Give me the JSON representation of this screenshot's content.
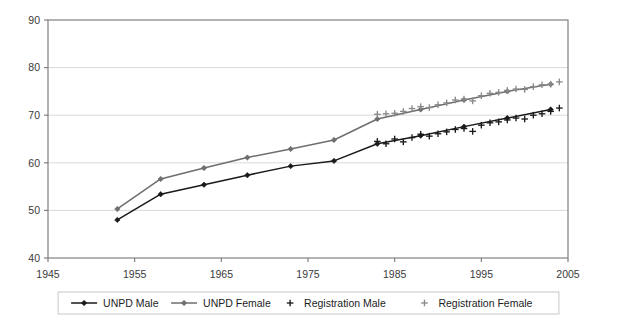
{
  "chart_data": {
    "type": "line",
    "title": "",
    "subtitle": "",
    "xlabel": "",
    "ylabel": "",
    "xlim": [
      1945,
      2005
    ],
    "ylim": [
      40,
      90
    ],
    "xticks": [
      1945,
      1955,
      1965,
      1975,
      1985,
      1995,
      2005
    ],
    "yticks": [
      40,
      50,
      60,
      70,
      80,
      90
    ],
    "grid": "horizontal",
    "legend_position": "bottom",
    "series": [
      {
        "name": "UNPD Male",
        "marker": "diamond",
        "style": "line-with-markers",
        "color": "#1a1a1a",
        "x": [
          1953,
          1958,
          1963,
          1968,
          1973,
          1978,
          1983,
          1988,
          1993,
          1998,
          2003
        ],
        "values": [
          48.0,
          53.4,
          55.4,
          57.4,
          59.3,
          60.4,
          64.0,
          65.7,
          67.6,
          69.4,
          71.2
        ]
      },
      {
        "name": "UNPD Female",
        "marker": "diamond",
        "style": "line-with-markers",
        "color": "#6e6e6e",
        "x": [
          1953,
          1958,
          1963,
          1968,
          1973,
          1978,
          1983,
          1988,
          1993,
          1998,
          2003
        ],
        "values": [
          50.3,
          56.6,
          58.9,
          61.1,
          62.9,
          64.8,
          69.2,
          71.2,
          73.2,
          75.0,
          76.5
        ]
      },
      {
        "name": "Registration Male",
        "marker": "plus",
        "style": "markers-only",
        "color": "#1a1a1a",
        "x": [
          1983,
          1984,
          1985,
          1986,
          1987,
          1988,
          1989,
          1990,
          1991,
          1992,
          1993,
          1994,
          1995,
          1996,
          1997,
          1998,
          1999,
          2000,
          2001,
          2002,
          2003,
          2004
        ],
        "values": [
          64.5,
          64.0,
          65.0,
          64.4,
          65.3,
          66.0,
          65.6,
          66.1,
          66.5,
          67.0,
          67.2,
          66.6,
          67.9,
          68.4,
          68.6,
          69.0,
          69.4,
          69.2,
          70.0,
          70.3,
          70.8,
          71.5
        ]
      },
      {
        "name": "Registration Female",
        "marker": "plus",
        "style": "markers-only",
        "color": "#8a8a8a",
        "x": [
          1983,
          1984,
          1985,
          1986,
          1987,
          1988,
          1989,
          1990,
          1991,
          1992,
          1993,
          1994,
          1995,
          1996,
          1997,
          1998,
          1999,
          2000,
          2001,
          2002,
          2003,
          2004
        ],
        "values": [
          70.2,
          70.3,
          70.4,
          70.8,
          71.4,
          71.8,
          71.6,
          72.2,
          72.6,
          73.2,
          73.4,
          73.0,
          74.1,
          74.6,
          74.8,
          75.2,
          75.5,
          75.4,
          76.0,
          76.4,
          76.5,
          77.0
        ]
      }
    ]
  },
  "axes": {
    "y_tick_labels": [
      "90",
      "80",
      "70",
      "60",
      "50",
      "40"
    ],
    "x_tick_labels": [
      "1945",
      "1955",
      "1965",
      "1975",
      "1985",
      "1995",
      "2005"
    ]
  },
  "legend": {
    "items": [
      {
        "label": "UNPD Male",
        "marker": "diamond-line",
        "color": "#1a1a1a"
      },
      {
        "label": "UNPD Female",
        "marker": "diamond-line",
        "color": "#6e6e6e"
      },
      {
        "label": "Registration Male",
        "marker": "plus",
        "color": "#1a1a1a"
      },
      {
        "label": "Registration Female",
        "marker": "plus",
        "color": "#8a8a8a"
      }
    ]
  },
  "colors": {
    "plot_border": "#808080",
    "gridline": "#d9d9d9",
    "background": "#ffffff",
    "legend_border": "#c8c8c8"
  }
}
